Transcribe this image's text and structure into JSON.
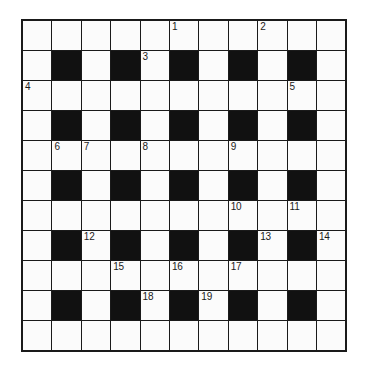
{
  "puzzle": {
    "type": "crossword-grid",
    "title": "Crossword Puzzle Grid",
    "columns": 11,
    "rows": 10,
    "cell_colors": {
      "white": "#fbfbfb",
      "black": "#111111",
      "border": "#1a1a1a",
      "number": "#1a1a1a",
      "background": "#ffffff"
    },
    "grid": [
      [
        {
          "black": false,
          "number": ""
        },
        {
          "black": false,
          "number": ""
        },
        {
          "black": false,
          "number": ""
        },
        {
          "black": false,
          "number": ""
        },
        {
          "black": false,
          "number": ""
        },
        {
          "black": false,
          "number": "1"
        },
        {
          "black": false,
          "number": ""
        },
        {
          "black": false,
          "number": ""
        },
        {
          "black": false,
          "number": "2"
        },
        {
          "black": false,
          "number": ""
        },
        {
          "black": false,
          "number": ""
        }
      ],
      [
        {
          "black": false,
          "number": ""
        },
        {
          "black": true,
          "number": ""
        },
        {
          "black": false,
          "number": ""
        },
        {
          "black": true,
          "number": ""
        },
        {
          "black": false,
          "number": "3"
        },
        {
          "black": true,
          "number": ""
        },
        {
          "black": false,
          "number": ""
        },
        {
          "black": true,
          "number": ""
        },
        {
          "black": false,
          "number": ""
        },
        {
          "black": true,
          "number": ""
        },
        {
          "black": false,
          "number": ""
        }
      ],
      [
        {
          "black": false,
          "number": "4"
        },
        {
          "black": false,
          "number": ""
        },
        {
          "black": false,
          "number": ""
        },
        {
          "black": false,
          "number": ""
        },
        {
          "black": false,
          "number": ""
        },
        {
          "black": false,
          "number": ""
        },
        {
          "black": false,
          "number": ""
        },
        {
          "black": false,
          "number": ""
        },
        {
          "black": false,
          "number": ""
        },
        {
          "black": false,
          "number": "5"
        },
        {
          "black": false,
          "number": ""
        }
      ],
      [
        {
          "black": false,
          "number": ""
        },
        {
          "black": true,
          "number": ""
        },
        {
          "black": false,
          "number": ""
        },
        {
          "black": true,
          "number": ""
        },
        {
          "black": false,
          "number": ""
        },
        {
          "black": true,
          "number": ""
        },
        {
          "black": false,
          "number": ""
        },
        {
          "black": true,
          "number": ""
        },
        {
          "black": false,
          "number": ""
        },
        {
          "black": true,
          "number": ""
        },
        {
          "black": false,
          "number": ""
        }
      ],
      [
        {
          "black": false,
          "number": ""
        },
        {
          "black": false,
          "number": "6"
        },
        {
          "black": false,
          "number": "7"
        },
        {
          "black": false,
          "number": ""
        },
        {
          "black": false,
          "number": "8"
        },
        {
          "black": false,
          "number": ""
        },
        {
          "black": false,
          "number": ""
        },
        {
          "black": false,
          "number": "9"
        },
        {
          "black": false,
          "number": ""
        },
        {
          "black": false,
          "number": ""
        },
        {
          "black": false,
          "number": ""
        }
      ],
      [
        {
          "black": false,
          "number": ""
        },
        {
          "black": true,
          "number": ""
        },
        {
          "black": false,
          "number": ""
        },
        {
          "black": true,
          "number": ""
        },
        {
          "black": false,
          "number": ""
        },
        {
          "black": true,
          "number": ""
        },
        {
          "black": false,
          "number": ""
        },
        {
          "black": true,
          "number": ""
        },
        {
          "black": false,
          "number": ""
        },
        {
          "black": true,
          "number": ""
        },
        {
          "black": false,
          "number": ""
        }
      ],
      [
        {
          "black": false,
          "number": ""
        },
        {
          "black": false,
          "number": ""
        },
        {
          "black": false,
          "number": ""
        },
        {
          "black": false,
          "number": ""
        },
        {
          "black": false,
          "number": ""
        },
        {
          "black": false,
          "number": ""
        },
        {
          "black": false,
          "number": ""
        },
        {
          "black": false,
          "number": "10"
        },
        {
          "black": false,
          "number": ""
        },
        {
          "black": false,
          "number": "11"
        },
        {
          "black": false,
          "number": ""
        }
      ],
      [
        {
          "black": false,
          "number": ""
        },
        {
          "black": true,
          "number": ""
        },
        {
          "black": false,
          "number": "12"
        },
        {
          "black": true,
          "number": ""
        },
        {
          "black": false,
          "number": ""
        },
        {
          "black": true,
          "number": ""
        },
        {
          "black": false,
          "number": ""
        },
        {
          "black": true,
          "number": ""
        },
        {
          "black": false,
          "number": "13"
        },
        {
          "black": true,
          "number": ""
        },
        {
          "black": false,
          "number": "14"
        }
      ],
      [
        {
          "black": false,
          "number": ""
        },
        {
          "black": false,
          "number": ""
        },
        {
          "black": false,
          "number": ""
        },
        {
          "black": false,
          "number": "15"
        },
        {
          "black": false,
          "number": ""
        },
        {
          "black": false,
          "number": "16"
        },
        {
          "black": false,
          "number": ""
        },
        {
          "black": false,
          "number": "17"
        },
        {
          "black": false,
          "number": ""
        },
        {
          "black": false,
          "number": ""
        },
        {
          "black": false,
          "number": ""
        }
      ],
      [
        {
          "black": false,
          "number": ""
        },
        {
          "black": true,
          "number": ""
        },
        {
          "black": false,
          "number": ""
        },
        {
          "black": true,
          "number": ""
        },
        {
          "black": false,
          "number": "18"
        },
        {
          "black": true,
          "number": ""
        },
        {
          "black": false,
          "number": "19"
        },
        {
          "black": true,
          "number": ""
        },
        {
          "black": false,
          "number": ""
        },
        {
          "black": true,
          "number": ""
        },
        {
          "black": false,
          "number": ""
        }
      ],
      [
        {
          "black": false,
          "number": ""
        },
        {
          "black": false,
          "number": ""
        },
        {
          "black": false,
          "number": ""
        },
        {
          "black": false,
          "number": ""
        },
        {
          "black": false,
          "number": ""
        },
        {
          "black": false,
          "number": ""
        },
        {
          "black": false,
          "number": ""
        },
        {
          "black": false,
          "number": ""
        },
        {
          "black": false,
          "number": ""
        },
        {
          "black": false,
          "number": ""
        },
        {
          "black": false,
          "number": ""
        }
      ]
    ]
  }
}
